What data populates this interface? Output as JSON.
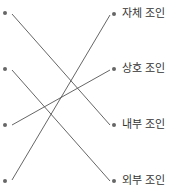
{
  "colors": {
    "line": "#555555",
    "dot": "#666666",
    "text": "#333333"
  },
  "left_points": [
    {
      "id": "L1",
      "y": 13
    },
    {
      "id": "L2",
      "y": 69
    },
    {
      "id": "L3",
      "y": 125
    },
    {
      "id": "L4",
      "y": 181
    }
  ],
  "right_items": [
    {
      "id": "R1",
      "label": "자체 조인",
      "y": 14
    },
    {
      "id": "R2",
      "label": "상호 조인",
      "y": 69
    },
    {
      "id": "R3",
      "label": "내부 조인",
      "y": 125
    },
    {
      "id": "R4",
      "label": "외부 조인",
      "y": 181
    }
  ],
  "connections": [
    {
      "from": "L1",
      "to": "R3"
    },
    {
      "from": "L2",
      "to": "R4"
    },
    {
      "from": "L3",
      "to": "R2"
    },
    {
      "from": "L4",
      "to": "R1"
    }
  ]
}
